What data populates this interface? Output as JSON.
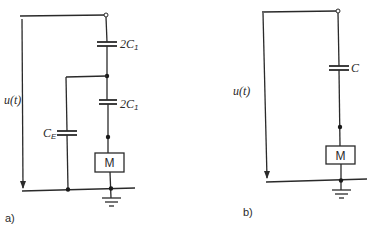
{
  "figure": {
    "panel_a": {
      "label": "a)",
      "source_label": "u(t)",
      "capacitor_top": {
        "label": "2C",
        "sub": "1"
      },
      "capacitor_mid": {
        "label": "2C",
        "sub": "1"
      },
      "capacitor_shunt": {
        "label": "C",
        "sub": "E"
      },
      "motor": {
        "label": "M"
      }
    },
    "panel_b": {
      "label": "b)",
      "source_label": "u(t)",
      "capacitor": {
        "label": "C"
      },
      "motor": {
        "label": "M"
      }
    }
  }
}
